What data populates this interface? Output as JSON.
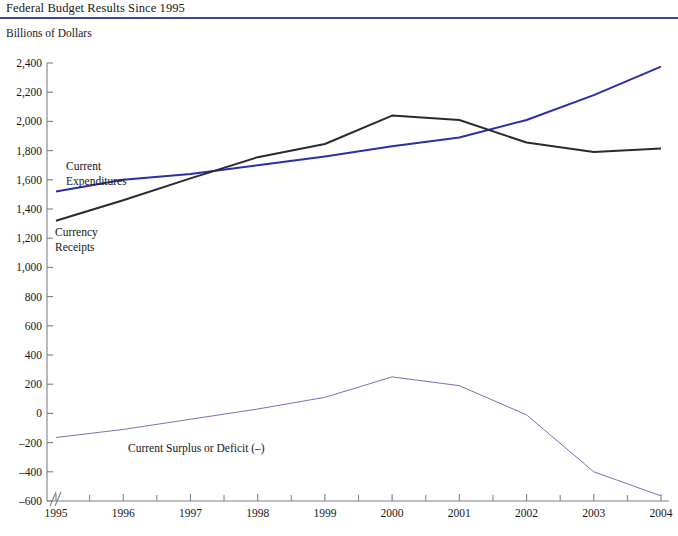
{
  "header": {
    "title": "Federal Budget Results Since 1995",
    "rule_color": "#3b4a8c"
  },
  "subtitle": "Billions of Dollars",
  "chart_data": {
    "type": "line",
    "title": "Federal Budget Results Since 1995",
    "subtitle": "Billions of Dollars",
    "xlabel": "",
    "ylabel": "Billions of Dollars",
    "x": [
      1995,
      1996,
      1997,
      1998,
      1999,
      2000,
      2001,
      2002,
      2003,
      2004
    ],
    "categories": [
      "1995",
      "1996",
      "1997",
      "1998",
      "1999",
      "2000",
      "2001",
      "2002",
      "2003",
      "2004"
    ],
    "xlim": [
      1995,
      2004
    ],
    "ylim": [
      -600,
      2400
    ],
    "yticks": [
      -600,
      -400,
      -200,
      0,
      200,
      400,
      600,
      800,
      1000,
      1200,
      1400,
      1600,
      1800,
      2000,
      2200,
      2400
    ],
    "ytick_labels": [
      "–600",
      "–400",
      "–200",
      "0",
      "200",
      "400",
      "600",
      "800",
      "1,000",
      "1,200",
      "1,400",
      "1,600",
      "1,800",
      "2,000",
      "2,200",
      "2,400"
    ],
    "grid": false,
    "legend": "inline-annotations",
    "axis_break": true,
    "series": [
      {
        "name": "Current Expenditures",
        "color": "#2b2fa8",
        "width": 2.0,
        "values": [
          1520,
          1600,
          1640,
          1700,
          1760,
          1830,
          1890,
          2010,
          2180,
          2375
        ],
        "label": "Current\nExpenditures",
        "label_lines": [
          "Current",
          "Expenditures"
        ]
      },
      {
        "name": "Currency Receipts",
        "color": "#2a2a2a",
        "width": 2.0,
        "values": [
          1320,
          1460,
          1610,
          1755,
          1845,
          2040,
          2010,
          1855,
          1790,
          1815
        ],
        "label": "Currency\nReceipts",
        "label_lines": [
          "Currency",
          "Receipts"
        ]
      },
      {
        "name": "Current Surplus or Deficit (–)",
        "color": "#6d77b8",
        "width": 1.0,
        "values": [
          -165,
          -110,
          -40,
          30,
          110,
          250,
          190,
          -10,
          -400,
          -565
        ],
        "label": "Current Surplus or Deficit (–)",
        "label_lines": [
          "Current Surplus or Deficit (–)"
        ]
      }
    ]
  },
  "annotations": {
    "expenditures_label_line1": "Current",
    "expenditures_label_line2": "Expenditures",
    "receipts_label_line1": "Currency",
    "receipts_label_line2": "Receipts",
    "deficit_label": "Current Surplus or Deficit (–)"
  }
}
